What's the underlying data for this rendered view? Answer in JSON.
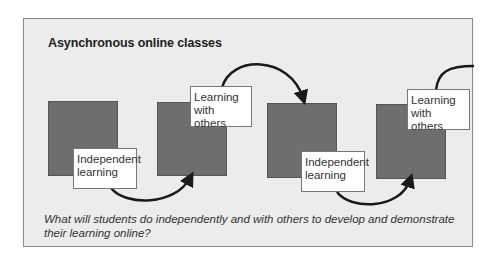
{
  "diagram": {
    "title": "Asynchronous online classes",
    "labels": [
      {
        "text_line1": "Independent",
        "text_line2": "learning"
      },
      {
        "text_line1": "Learning",
        "text_line2": "with others"
      },
      {
        "text_line1": "Independent",
        "text_line2": "learning"
      },
      {
        "text_line1": "Learning",
        "text_line2": "with others"
      }
    ],
    "question": "What will students do independently and with others to develop and demonstrate their learning online?",
    "colors": {
      "background": "#ececec",
      "block": "#6e6e6e",
      "label_bg": "#ffffff",
      "arrow": "#1a1a1a"
    }
  }
}
